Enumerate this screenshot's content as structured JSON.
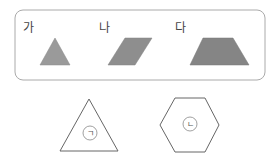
{
  "box": {
    "shapes": [
      {
        "label": "가",
        "type": "triangle",
        "fill": "#9a9a9a"
      },
      {
        "label": "나",
        "type": "parallelogram",
        "fill": "#8e8e8e"
      },
      {
        "label": "다",
        "type": "trapezoid",
        "fill": "#858585"
      }
    ]
  },
  "bottom": {
    "shapes": [
      {
        "type": "triangle",
        "marker": "ㄱ"
      },
      {
        "type": "hexagon",
        "marker": "ㄴ"
      }
    ]
  },
  "colors": {
    "border": "#aaaaaa",
    "outline": "#666666"
  }
}
